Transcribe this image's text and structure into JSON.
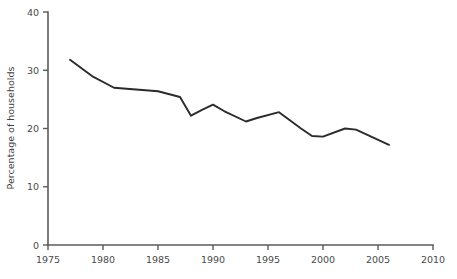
{
  "chart_data": {
    "type": "line",
    "title": "",
    "subtitle": "",
    "xlabel": "",
    "ylabel": "Percentage of households",
    "xlim": [
      1975,
      2010
    ],
    "ylim": [
      0,
      40
    ],
    "grid": false,
    "legend": false,
    "legend_position": "none",
    "line_color": "#2b2b2b",
    "axis_color": "#5a5a5a",
    "x_ticks": [
      1975,
      1980,
      1985,
      1990,
      1995,
      2000,
      2005,
      2010
    ],
    "x_tick_labels": [
      "1975",
      "1980",
      "1985",
      "1990",
      "1995",
      "2000",
      "2005",
      "2010"
    ],
    "y_ticks": [
      0,
      10,
      20,
      30,
      40
    ],
    "y_tick_labels": [
      "0",
      "10",
      "20",
      "30",
      "40"
    ],
    "series": [
      {
        "name": "Percentage of households",
        "x": [
          1977,
          1979,
          1981,
          1985,
          1987,
          1988,
          1989,
          1990,
          1991,
          1993,
          1994,
          1996,
          1998,
          1999,
          2000,
          2002,
          2003,
          2006
        ],
        "values": [
          31.8,
          29.0,
          27.0,
          26.4,
          25.4,
          22.2,
          23.2,
          24.1,
          23.0,
          21.2,
          21.8,
          22.8,
          20.0,
          18.7,
          18.6,
          20.0,
          19.8,
          17.2
        ]
      }
    ]
  }
}
